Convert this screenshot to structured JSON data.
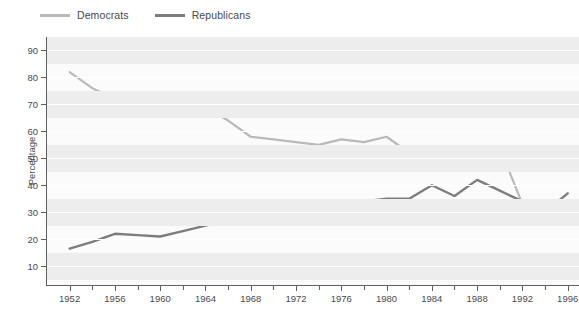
{
  "legend": {
    "position": "top-left",
    "items": [
      {
        "label": "Democrats",
        "color": "#b9b9b9"
      },
      {
        "label": "Republicans",
        "color": "#7d7d7d"
      }
    ]
  },
  "axes": {
    "y_title": "Percentage",
    "y_ticks": [
      10,
      20,
      30,
      40,
      50,
      60,
      70,
      80,
      90
    ],
    "y_min": 3,
    "y_max": 95,
    "x_ticks": [
      1952,
      1956,
      1960,
      1964,
      1968,
      1972,
      1976,
      1980,
      1984,
      1988,
      1992,
      1996
    ],
    "x_min": 1950,
    "x_max": 1997
  },
  "style": {
    "band_color": "#ededed",
    "plot_bg": "#fbfbfb",
    "gridline_color": "#ffffff",
    "axis_color": "#5f5f5f",
    "text_color": "#4a4a4a"
  },
  "chart_data": {
    "type": "line",
    "title": "",
    "xlabel": "",
    "ylabel": "Percentage",
    "xlim": [
      1950,
      1997
    ],
    "ylim": [
      3,
      95
    ],
    "grid": true,
    "legend_position": "top-left",
    "x": [
      1952,
      1954,
      1956,
      1958,
      1960,
      1962,
      1964,
      1966,
      1968,
      1970,
      1972,
      1974,
      1976,
      1978,
      1980,
      1982,
      1984,
      1986,
      1988,
      1990,
      1992,
      1994,
      1996
    ],
    "series": [
      {
        "name": "Democrats",
        "color": "#b9b9b9",
        "values": [
          82,
          76,
          72,
          72,
          71,
          70,
          69,
          64,
          58,
          57,
          56,
          55,
          57,
          56,
          58,
          52,
          46,
          53,
          53,
          54,
          33,
          31,
          33
        ]
      },
      {
        "name": "Republicans",
        "color": "#7d7d7d",
        "values": [
          16.5,
          19,
          22,
          21.5,
          21,
          23,
          25,
          27,
          29,
          31,
          32,
          33,
          33.5,
          34,
          35,
          35,
          40,
          36,
          42,
          38,
          34,
          30,
          37
        ]
      }
    ]
  }
}
